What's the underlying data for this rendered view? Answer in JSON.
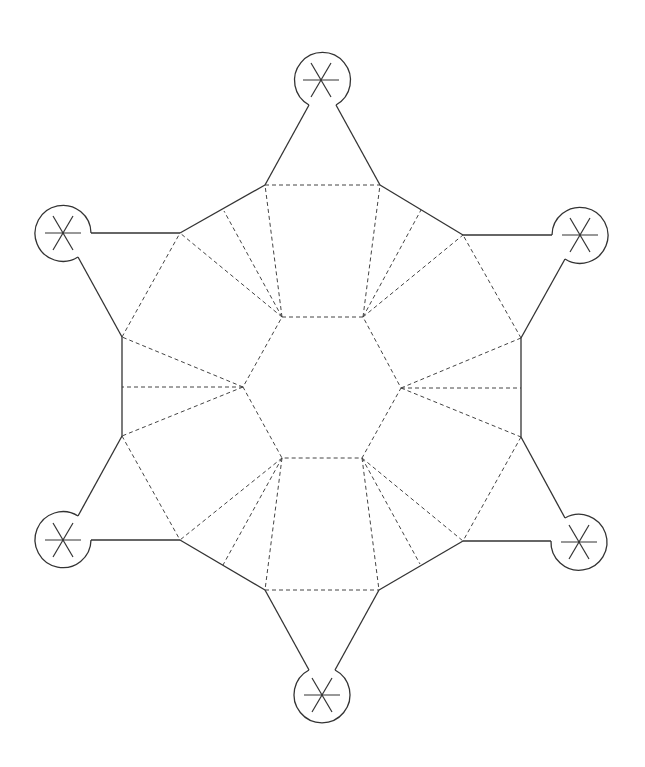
{
  "diagram": {
    "title": "",
    "type": "papercraft-net",
    "colors": {
      "cut_line": "#333333",
      "fold_line": "#444444",
      "background": "#ffffff"
    },
    "legend": {
      "solid": "cut line",
      "dashed": "fold line"
    },
    "inner_hexagon": [
      [
        282,
        317
      ],
      [
        363,
        317
      ],
      [
        401,
        388
      ],
      [
        362,
        458
      ],
      [
        282,
        458
      ],
      [
        243,
        387
      ]
    ],
    "outer_vertices": [
      [
        265,
        185
      ],
      [
        380,
        185
      ],
      [
        463,
        235
      ],
      [
        521,
        338
      ],
      [
        521,
        437
      ],
      [
        463,
        541
      ],
      [
        379,
        590
      ],
      [
        265,
        590
      ],
      [
        180,
        540
      ],
      [
        122,
        436
      ],
      [
        122,
        337
      ],
      [
        180,
        233
      ]
    ],
    "tabs": [
      {
        "name": "top",
        "center": [
          321,
          80
        ]
      },
      {
        "name": "top-right",
        "center": [
          580,
          235
        ]
      },
      {
        "name": "bottom-right",
        "center": [
          579,
          542
        ]
      },
      {
        "name": "bottom",
        "center": [
          322,
          695
        ]
      },
      {
        "name": "bottom-left",
        "center": [
          63,
          540
        ]
      },
      {
        "name": "top-left",
        "center": [
          63,
          233
        ]
      }
    ],
    "tab_radius": 28
  }
}
